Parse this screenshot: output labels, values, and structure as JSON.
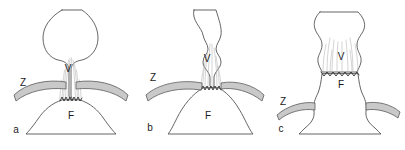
{
  "figure": {
    "name": "three-panel-anatomical-diagram",
    "background_color": "#ffffff",
    "line_color": "#4a4a4a",
    "band_fill_color": "#c9c9c9",
    "band_stroke_color": "#5a5a5a",
    "strand_color": "#b0b0b0",
    "zigzag_color": "#2e2e2e",
    "label_color": "#1a1a1a"
  },
  "panels": [
    {
      "id": "a",
      "letter": "a",
      "labels": {
        "upper": "V",
        "lower": "F",
        "band": "Z"
      }
    },
    {
      "id": "b",
      "letter": "b",
      "labels": {
        "upper": "V",
        "lower": "F",
        "band": "Z"
      }
    },
    {
      "id": "c",
      "letter": "c",
      "labels": {
        "upper": "V",
        "lower": "F",
        "band": "Z"
      }
    }
  ]
}
